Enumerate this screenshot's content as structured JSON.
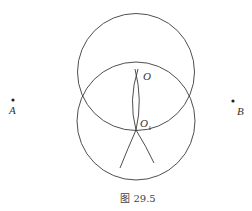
{
  "figure": {
    "caption": "图 29.5",
    "stroke_color": "#3a3a3a",
    "points": {
      "A": {
        "label": "A",
        "x": 13,
        "y": 100
      },
      "B": {
        "label": "B",
        "x": 233,
        "y": 101
      },
      "O": {
        "label": "O",
        "x": 136.5,
        "y": 72
      },
      "O1": {
        "label": "O",
        "sub": "1",
        "x": 136,
        "y": 130
      }
    },
    "circles": [
      {
        "name": "upper-circle",
        "cx": 136,
        "cy": 72,
        "r": 58.5
      },
      {
        "name": "lower-circle",
        "cx": 136,
        "cy": 121,
        "r": 59
      }
    ]
  }
}
